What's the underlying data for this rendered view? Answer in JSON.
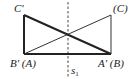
{
  "diagram": {
    "type": "geometry-reflection",
    "axis_label": "s",
    "axis_subscript": "1",
    "labels": {
      "top_left": "C'",
      "top_right": "(C)",
      "bottom_left": "B' (A)",
      "bottom_right": "A' (B)"
    },
    "points": {
      "C_prime": [
        24,
        15
      ],
      "C": [
        111,
        15
      ],
      "B_prime_A": [
        24,
        54
      ],
      "A_prime_B": [
        111,
        54
      ]
    },
    "axis_x": 68,
    "colors": {
      "stroke": "#222222",
      "background": "#ffffff"
    }
  }
}
